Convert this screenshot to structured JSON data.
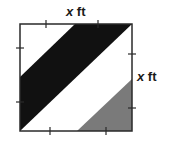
{
  "labels": {
    "top": {
      "variable": "x",
      "unit": "ft"
    },
    "right": {
      "variable": "x",
      "unit": "ft"
    }
  },
  "colors": {
    "outline": "#2a2a2a",
    "dark_band": "#111111",
    "gray_triangle": "#7a7a7a",
    "background": "#ffffff"
  },
  "figure": {
    "shape": "square",
    "tick_marks_per_side": 2,
    "regions": [
      "black diagonal band",
      "white diagonal band",
      "gray corner triangle"
    ]
  }
}
